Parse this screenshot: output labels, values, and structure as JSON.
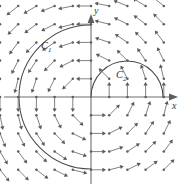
{
  "figure": {
    "kind": "vector-field-plot",
    "width": 186,
    "height": 187,
    "background": "#ffffff"
  },
  "axes": {
    "x_label": "x",
    "y_label": "y",
    "origin_px": [
      91,
      97
    ],
    "x_axis_color": "#6e6e70",
    "y_axis_color": "#6e6e70",
    "x_axis_span_px": [
      4,
      178
    ],
    "y_axis_span_px": [
      14,
      184
    ],
    "grid": false
  },
  "curves": [
    {
      "id": "C1",
      "label": "C",
      "subscript": "1",
      "shape": "circle-arc",
      "description": "large arc through left half plane from y-axis top to y-axis bottom",
      "color": "#4a4a4c",
      "center_px": [
        91,
        97
      ],
      "radius_px": 72,
      "label_pos_px": [
        41,
        41
      ]
    },
    {
      "id": "C2",
      "label": "C",
      "subscript": "2",
      "shape": "semicircle",
      "description": "upper semicircle in right half plane anchored at origin and on positive x-axis",
      "color": "#4a4a4c",
      "center_px": [
        127,
        97
      ],
      "radius_px": 36,
      "label_pos_px": [
        116,
        70
      ]
    }
  ],
  "chart_data": {
    "type": "scatter",
    "title": "",
    "xlabel": "x",
    "ylabel": "y",
    "grid": false,
    "field_type": "rotational",
    "field_formula": "F = (-y, x) / |(x,y)| (unit circulation field, counter-clockwise)",
    "arrow_color": "#6a6a6e",
    "arrow_count": 100,
    "sample_grid": {
      "columns": 10,
      "rows": 10,
      "x_range": [
        -5.0,
        4.0
      ],
      "y_range": [
        -4.0,
        5.0
      ],
      "step": 1.0
    },
    "notes": [
      "Each sample point is drawn as a small filled dot with a line segment and arrowhead.",
      "Arrows in quadrant II point left/up-left; quadrant I point up/up-right;",
      "quadrant III point down/down-left; quadrant IV point right/down-right."
    ]
  }
}
